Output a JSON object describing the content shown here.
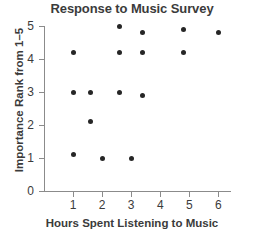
{
  "chart_data": {
    "type": "scatter",
    "title": "Response to Music Survey",
    "xlabel": "Hours Spent Listening to Music",
    "ylabel": "Importance Rank from 1–5",
    "xlim": [
      0,
      6.4
    ],
    "ylim": [
      0,
      5
    ],
    "grid": false,
    "legend": null,
    "xticks": [
      1,
      2,
      3,
      4,
      5,
      6
    ],
    "yticks": [
      0,
      1,
      2,
      3,
      4,
      5
    ],
    "xtick_labels": [
      "1",
      "2",
      "3",
      "4",
      "5",
      "6"
    ],
    "ytick_labels": [
      "0",
      "1",
      "2",
      "3",
      "4",
      "5"
    ],
    "marker": "filled-circle",
    "marker_color": "#262626",
    "points": [
      {
        "x": 1.0,
        "y": 4.2
      },
      {
        "x": 1.0,
        "y": 3.0
      },
      {
        "x": 1.0,
        "y": 1.1
      },
      {
        "x": 1.6,
        "y": 3.0
      },
      {
        "x": 1.6,
        "y": 2.1
      },
      {
        "x": 2.0,
        "y": 1.0
      },
      {
        "x": 2.6,
        "y": 5.0
      },
      {
        "x": 2.6,
        "y": 4.2
      },
      {
        "x": 2.6,
        "y": 3.0
      },
      {
        "x": 3.0,
        "y": 1.0
      },
      {
        "x": 3.4,
        "y": 4.8
      },
      {
        "x": 3.4,
        "y": 4.2
      },
      {
        "x": 3.4,
        "y": 2.9
      },
      {
        "x": 4.8,
        "y": 4.9
      },
      {
        "x": 4.8,
        "y": 4.2
      },
      {
        "x": 6.0,
        "y": 4.8
      }
    ]
  },
  "axis_color": "#8b8b8b",
  "text_color": "#3b3b3b"
}
